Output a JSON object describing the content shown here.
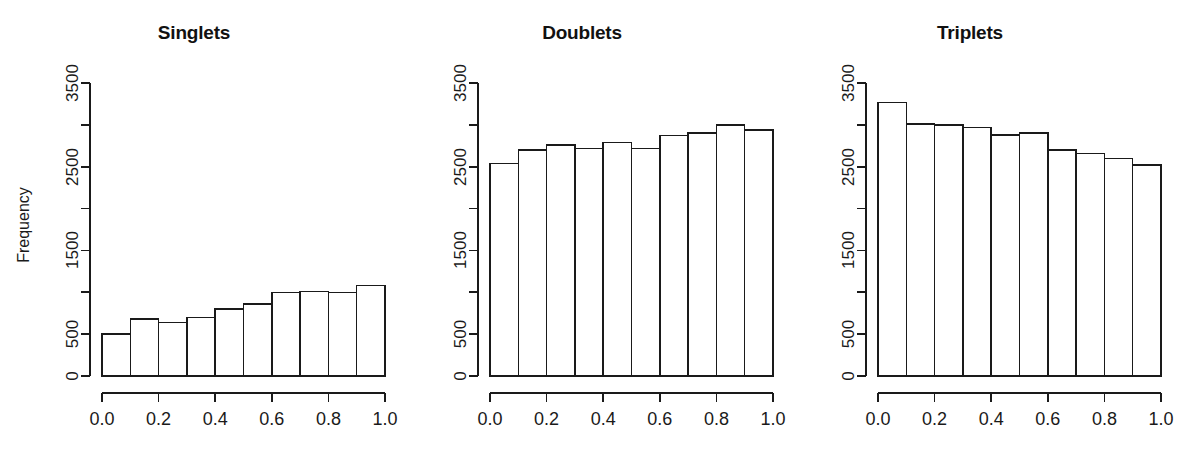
{
  "figure": {
    "background_color": "#ffffff",
    "foreground_color": "#1a1a1a",
    "ylabel": "Frequency"
  },
  "chart_data": [
    {
      "type": "bar",
      "title": "Singlets",
      "xlabel": "",
      "ylabel": "Frequency",
      "xlim": [
        0.0,
        1.0
      ],
      "ylim": [
        0,
        3500
      ],
      "grid": false,
      "legend": false,
      "xticks": [
        "0.0",
        "0.2",
        "0.4",
        "0.6",
        "0.8",
        "1.0"
      ],
      "xtick_values": [
        0.0,
        0.2,
        0.4,
        0.6,
        0.8,
        1.0
      ],
      "yticks": [
        "0",
        "500",
        "1500",
        "2500",
        "3500"
      ],
      "ytick_values": [
        0,
        500,
        1500,
        2500,
        3500
      ],
      "ytick_minor_values": [
        1000,
        2000,
        3000
      ],
      "bin_edges": [
        0.0,
        0.1,
        0.2,
        0.3,
        0.4,
        0.5,
        0.6,
        0.7,
        0.8,
        0.9,
        1.0
      ],
      "categories": [
        "0.0-0.1",
        "0.1-0.2",
        "0.2-0.3",
        "0.3-0.4",
        "0.4-0.5",
        "0.5-0.6",
        "0.6-0.7",
        "0.7-0.8",
        "0.8-0.9",
        "0.9-1.0"
      ],
      "values": [
        500,
        680,
        640,
        700,
        800,
        860,
        1000,
        1010,
        1000,
        1080
      ]
    },
    {
      "type": "bar",
      "title": "Doublets",
      "xlabel": "",
      "ylabel": "",
      "xlim": [
        0.0,
        1.0
      ],
      "ylim": [
        0,
        3500
      ],
      "grid": false,
      "legend": false,
      "xticks": [
        "0.0",
        "0.2",
        "0.4",
        "0.6",
        "0.8",
        "1.0"
      ],
      "xtick_values": [
        0.0,
        0.2,
        0.4,
        0.6,
        0.8,
        1.0
      ],
      "yticks": [
        "0",
        "500",
        "1500",
        "2500",
        "3500"
      ],
      "ytick_values": [
        0,
        500,
        1500,
        2500,
        3500
      ],
      "ytick_minor_values": [
        1000,
        2000,
        3000
      ],
      "bin_edges": [
        0.0,
        0.1,
        0.2,
        0.3,
        0.4,
        0.5,
        0.6,
        0.7,
        0.8,
        0.9,
        1.0
      ],
      "categories": [
        "0.0-0.1",
        "0.1-0.2",
        "0.2-0.3",
        "0.3-0.4",
        "0.4-0.5",
        "0.5-0.6",
        "0.6-0.7",
        "0.7-0.8",
        "0.8-0.9",
        "0.9-1.0"
      ],
      "values": [
        2540,
        2700,
        2760,
        2720,
        2790,
        2720,
        2870,
        2900,
        3000,
        2940
      ]
    },
    {
      "type": "bar",
      "title": "Triplets",
      "xlabel": "",
      "ylabel": "",
      "xlim": [
        0.0,
        1.0
      ],
      "ylim": [
        0,
        3500
      ],
      "grid": false,
      "legend": false,
      "xticks": [
        "0.0",
        "0.2",
        "0.4",
        "0.6",
        "0.8",
        "1.0"
      ],
      "xtick_values": [
        0.0,
        0.2,
        0.4,
        0.6,
        0.8,
        1.0
      ],
      "yticks": [
        "0",
        "500",
        "1500",
        "2500",
        "3500"
      ],
      "ytick_values": [
        0,
        500,
        1500,
        2500,
        3500
      ],
      "ytick_minor_values": [
        1000,
        2000,
        3000
      ],
      "bin_edges": [
        0.0,
        0.1,
        0.2,
        0.3,
        0.4,
        0.5,
        0.6,
        0.7,
        0.8,
        0.9,
        1.0
      ],
      "categories": [
        "0.0-0.1",
        "0.1-0.2",
        "0.2-0.3",
        "0.3-0.4",
        "0.4-0.5",
        "0.5-0.6",
        "0.6-0.7",
        "0.7-0.8",
        "0.8-0.9",
        "0.9-1.0"
      ],
      "values": [
        3270,
        3010,
        3000,
        2970,
        2880,
        2900,
        2700,
        2660,
        2600,
        2520
      ]
    }
  ]
}
